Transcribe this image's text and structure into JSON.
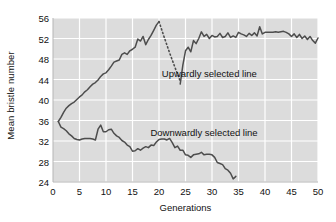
{
  "chart_data": {
    "type": "line",
    "title": "",
    "xlabel": "Generations",
    "ylabel": "Mean bristle number",
    "xlim": [
      0,
      50
    ],
    "ylim": [
      24,
      56
    ],
    "xticks": [
      0,
      5,
      10,
      15,
      20,
      25,
      30,
      35,
      40,
      45,
      50
    ],
    "yticks": [
      24,
      28,
      32,
      36,
      40,
      44,
      48,
      52,
      56
    ],
    "grid": true,
    "legend_position": "inline-annotations",
    "plot_background": "#dcdcdc",
    "gridline_color": "#ffffff",
    "line_color": "#4d4d4d",
    "series": [
      {
        "name": "Upwardly selected line",
        "style": "solid",
        "x": [
          1,
          1.5,
          2,
          2.5,
          3,
          3.5,
          4,
          4.5,
          5,
          5.5,
          6,
          6.5,
          7,
          7.5,
          8,
          8.5,
          9,
          9.5,
          10,
          10.5,
          11,
          11.5,
          12,
          12.5,
          13,
          13.5,
          14,
          14.5,
          15,
          15.5,
          16,
          16.5,
          17,
          17.5,
          18,
          18.5,
          19,
          19.5,
          20
        ],
        "y": [
          35.8,
          36.6,
          37.6,
          38.4,
          38.9,
          39.3,
          39.6,
          40.1,
          40.6,
          41.0,
          41.6,
          42.0,
          42.6,
          43.1,
          43.4,
          43.9,
          44.6,
          45.1,
          45.3,
          45.9,
          46.6,
          47.4,
          47.6,
          47.8,
          48.9,
          49.2,
          48.9,
          49.6,
          49.9,
          50.3,
          51.9,
          51.5,
          52.4,
          50.8,
          51.8,
          52.6,
          53.6,
          54.6,
          55.3
        ]
      },
      {
        "name": "Upwardly selected line (relaxed/dotted)",
        "style": "dotted",
        "x": [
          20,
          21,
          22,
          23,
          24
        ],
        "y": [
          55.3,
          52.2,
          49.2,
          46.4,
          43.7
        ]
      },
      {
        "name": "Upwardly selected line (resumed)",
        "style": "solid",
        "x": [
          24,
          24.5,
          25,
          25.5,
          26,
          26.5,
          27,
          27.5,
          28,
          28.5,
          29,
          29.5,
          30,
          30.5,
          31,
          31.5,
          32,
          32.5,
          33,
          33.5,
          34,
          34.5,
          35,
          35.5,
          36,
          36.5,
          37,
          37.5,
          38,
          38.5,
          39,
          39.5,
          40,
          40.5,
          41,
          41.5,
          42,
          42.5,
          43,
          43.5,
          44,
          44.5,
          45,
          45.5,
          46,
          46.5,
          47,
          47.5,
          48,
          48.5,
          49,
          49.5,
          50
        ],
        "y": [
          43.1,
          46.8,
          49.6,
          50.3,
          49.4,
          51.6,
          51.0,
          52.0,
          53.3,
          52.4,
          52.8,
          52.0,
          52.6,
          52.3,
          52.4,
          53.0,
          52.2,
          52.4,
          53.1,
          52.2,
          52.5,
          52.2,
          53.2,
          52.9,
          52.7,
          52.4,
          53.0,
          52.6,
          53.1,
          52.5,
          54.3,
          52.9,
          53.2,
          53.2,
          53.2,
          53.2,
          53.3,
          53.2,
          53.3,
          53.4,
          53.2,
          52.9,
          52.4,
          52.9,
          52.2,
          52.8,
          52.0,
          52.5,
          51.8,
          52.4,
          51.6,
          51.1,
          52.1
        ]
      },
      {
        "name": "Downwardly selected line",
        "style": "solid",
        "x": [
          1,
          1.5,
          2,
          2.5,
          3,
          3.5,
          4,
          4.5,
          5,
          5.5,
          6,
          6.5,
          7,
          7.5,
          8,
          8.5,
          9,
          9.5,
          10,
          10.5,
          11,
          11.5,
          12,
          12.5,
          13,
          13.5,
          14,
          14.5,
          15,
          15.5,
          16,
          16.5,
          17,
          17.5,
          18,
          18.5,
          19,
          19.5,
          20,
          20.5,
          21,
          21.5,
          22,
          22.5,
          23,
          23.5,
          24,
          24.5,
          25,
          25.5,
          26,
          26.5,
          27,
          27.5,
          28,
          28.5,
          29,
          29.5,
          30,
          30.5,
          31,
          31.5,
          32,
          32.5,
          33,
          33.5,
          34,
          34.5
        ],
        "y": [
          35.8,
          34.7,
          34.4,
          34.0,
          33.4,
          33.0,
          32.5,
          32.3,
          32.2,
          32.4,
          32.5,
          32.5,
          32.5,
          32.4,
          32.2,
          34.3,
          35.1,
          33.8,
          33.8,
          34.2,
          34.3,
          33.5,
          33.0,
          32.7,
          32.1,
          31.8,
          31.2,
          30.9,
          30.0,
          30.1,
          30.5,
          30.2,
          30.6,
          30.9,
          30.7,
          31.2,
          31.1,
          31.8,
          32.3,
          32.4,
          32.4,
          32.2,
          32.5,
          31.7,
          30.7,
          31.0,
          30.2,
          30.2,
          29.3,
          29.2,
          28.8,
          29.3,
          29.4,
          29.5,
          29.8,
          29.3,
          29.4,
          29.4,
          29.3,
          28.8,
          27.8,
          27.6,
          27.4,
          26.6,
          26.3,
          25.7,
          24.6,
          25.1
        ]
      }
    ],
    "annotations": [
      {
        "text": "Upwardly selected line",
        "x": 29.5,
        "y": 45.0
      },
      {
        "text": "Downwardly selected line",
        "x": 28.5,
        "y": 33.5
      }
    ]
  }
}
